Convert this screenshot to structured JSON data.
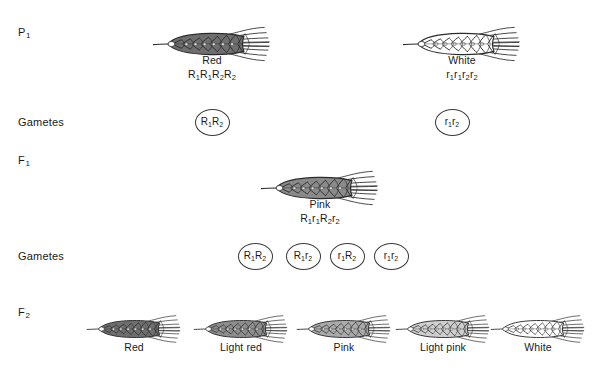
{
  "diagram": {
    "ink_color": "#2b2b2b",
    "circle_color": "#3a3a3a"
  },
  "rows": {
    "p1": {
      "label": "P",
      "sub": "1"
    },
    "gametes_p": {
      "label": "Gametes",
      "sub": ""
    },
    "f1": {
      "label": "F",
      "sub": "1"
    },
    "gametes_f1": {
      "label": "Gametes",
      "sub": ""
    },
    "f2": {
      "label": "F",
      "sub": "2"
    }
  },
  "parents": [
    {
      "phenotype": "Red",
      "genotype_parts": [
        {
          "letter": "R",
          "sub": "1"
        },
        {
          "letter": "R",
          "sub": "1"
        },
        {
          "letter": "R",
          "sub": "2"
        },
        {
          "letter": "R",
          "sub": "2"
        }
      ],
      "shade": "#6e6e6e",
      "x": 212,
      "y": 24,
      "scale": 1.0
    },
    {
      "phenotype": "White",
      "genotype_parts": [
        {
          "letter": "r",
          "sub": "1"
        },
        {
          "letter": "r",
          "sub": "1"
        },
        {
          "letter": "r",
          "sub": "2"
        },
        {
          "letter": "r",
          "sub": "2"
        }
      ],
      "shade": "#ffffff",
      "x": 462,
      "y": 24,
      "scale": 1.0
    }
  ],
  "parent_gametes": [
    {
      "parts": [
        {
          "letter": "R",
          "sub": "1"
        },
        {
          "letter": "R",
          "sub": "2"
        }
      ],
      "x": 212,
      "y": 122
    },
    {
      "parts": [
        {
          "letter": "r",
          "sub": "1"
        },
        {
          "letter": "r",
          "sub": "2"
        }
      ],
      "x": 452,
      "y": 122
    }
  ],
  "f1": {
    "phenotype": "Pink",
    "genotype_parts": [
      {
        "letter": "R",
        "sub": "1"
      },
      {
        "letter": "r",
        "sub": "1"
      },
      {
        "letter": "R",
        "sub": "2"
      },
      {
        "letter": "r",
        "sub": "2"
      }
    ],
    "shade": "#8a8a8a",
    "x": 320,
    "y": 168
  },
  "f1_gametes": [
    {
      "parts": [
        {
          "letter": "R",
          "sub": "1"
        },
        {
          "letter": "R",
          "sub": "2"
        }
      ],
      "x": 255,
      "y": 256
    },
    {
      "parts": [
        {
          "letter": "R",
          "sub": "1"
        },
        {
          "letter": "r",
          "sub": "2"
        }
      ],
      "x": 303,
      "y": 256
    },
    {
      "parts": [
        {
          "letter": "r",
          "sub": "1"
        },
        {
          "letter": "R",
          "sub": "2"
        }
      ],
      "x": 347,
      "y": 256
    },
    {
      "parts": [
        {
          "letter": "r",
          "sub": "1"
        },
        {
          "letter": "r",
          "sub": "2"
        }
      ],
      "x": 391,
      "y": 256
    }
  ],
  "f2": [
    {
      "phenotype": "Red",
      "shade": "#6e6e6e",
      "x": 134,
      "y": 313
    },
    {
      "phenotype": "Light red",
      "shade": "#8d8d8d",
      "x": 241,
      "y": 313
    },
    {
      "phenotype": "Pink",
      "shade": "#aaaaaa",
      "x": 344,
      "y": 313
    },
    {
      "phenotype": "Light pink",
      "shade": "#cfcfcf",
      "x": 443,
      "y": 313
    },
    {
      "phenotype": "White",
      "shade": "#ffffff",
      "x": 538,
      "y": 313
    }
  ]
}
